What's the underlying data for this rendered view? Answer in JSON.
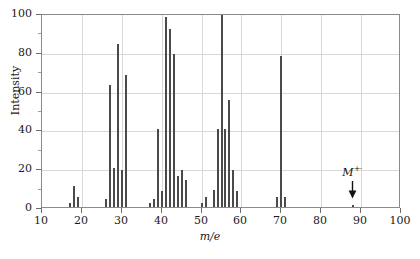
{
  "chart_data": {
    "type": "bar",
    "title": "",
    "xlabel": "m/e",
    "ylabel": "Intensity",
    "xlim": [
      10,
      100
    ],
    "ylim": [
      0,
      100
    ],
    "grid": true,
    "legend": null,
    "x_major_ticks": [
      10,
      20,
      30,
      40,
      50,
      60,
      70,
      80,
      90,
      100
    ],
    "x_tick_labels": [
      "10",
      "20",
      "30",
      "40",
      "50",
      "60",
      "70",
      "80",
      "90",
      "100"
    ],
    "y_major_ticks": [
      0,
      20,
      40,
      60,
      80,
      100
    ],
    "y_tick_labels": [
      "0",
      "20",
      "40",
      "60",
      "80",
      "100"
    ],
    "y_minor_ticks": [
      10,
      30,
      50,
      70,
      90
    ],
    "x": [
      17,
      18,
      19,
      26,
      27,
      28,
      29,
      30,
      31,
      37,
      38,
      39,
      40,
      41,
      42,
      43,
      44,
      45,
      46,
      50,
      51,
      53,
      54,
      55,
      56,
      57,
      58,
      59,
      69,
      70,
      71,
      88
    ],
    "values": [
      2,
      11,
      5,
      4,
      63,
      20,
      84,
      19,
      68,
      2,
      4,
      40,
      8,
      98,
      92,
      79,
      16,
      19,
      14,
      2,
      5,
      9,
      40,
      100,
      40,
      55,
      19,
      8,
      5,
      78,
      5,
      1
    ],
    "annotations": [
      {
        "name": "molecular-ion-marker",
        "label": "M",
        "superscript": "+·",
        "x": 88,
        "y": 22,
        "arrow": "down"
      }
    ],
    "bar_color": "#4a4a4a",
    "grid_color": "#d8d8d8",
    "axis_color": "#8a8a8a",
    "background_color": "#ffffff"
  }
}
